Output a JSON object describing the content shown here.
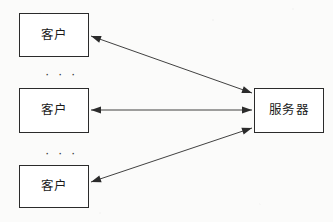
{
  "diagram": {
    "background_color": "#fbfbfa",
    "line_color": "#2b2b2b",
    "box_fill": "#ffffff",
    "nodes": [
      {
        "id": "client-top",
        "label": "客户",
        "x": 19,
        "y": 13,
        "width": 70,
        "height": 44
      },
      {
        "id": "client-middle",
        "label": "客户",
        "x": 19,
        "y": 88,
        "width": 70,
        "height": 45
      },
      {
        "id": "client-bottom",
        "label": "客户",
        "x": 19,
        "y": 165,
        "width": 70,
        "height": 43
      },
      {
        "id": "server",
        "label": "服务器",
        "x": 254,
        "y": 88,
        "width": 70,
        "height": 45
      }
    ],
    "ellipses": [
      {
        "id": "ellipsis-upper",
        "label": "· · ·",
        "x": 45,
        "y": 67
      },
      {
        "id": "ellipsis-lower",
        "label": "· · ·",
        "x": 45,
        "y": 146
      }
    ],
    "connectors": [
      {
        "id": "connector-top",
        "from": "client-top",
        "to": "server",
        "x1": 91,
        "y1": 36,
        "x2": 252,
        "y2": 93,
        "arrow_start": true,
        "arrow_end": true
      },
      {
        "id": "connector-middle",
        "from": "client-middle",
        "to": "server",
        "x1": 91,
        "y1": 110,
        "x2": 252,
        "y2": 110,
        "arrow_start": true,
        "arrow_end": true
      },
      {
        "id": "connector-bottom",
        "from": "client-bottom",
        "to": "server",
        "x1": 91,
        "y1": 182,
        "x2": 252,
        "y2": 128,
        "arrow_start": true,
        "arrow_end": true
      }
    ]
  }
}
